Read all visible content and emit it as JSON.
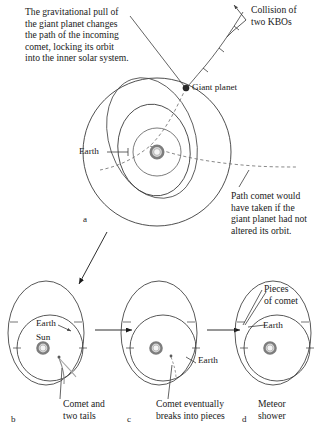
{
  "figure": {
    "background_color": "#ffffff",
    "ink_color": "#1a1a1a",
    "sun_color": "#8f8f8f",
    "planet_color": "#2b2b2b"
  },
  "panel_a": {
    "letter": "a",
    "caption_main": "The gravitational pull of\nthe giant planet changes\nthe path of the incoming\ncomet, locking its orbit\ninto the inner solar system.",
    "collision_label": "Collision of\ntwo KBOs",
    "giant_planet_label": "Giant planet",
    "earth_label": "Earth",
    "dashed_path_label": "Path comet would\nhave taken if the\ngiant planet had not\naltered its orbit."
  },
  "panel_b": {
    "letter": "b",
    "earth_label": "Earth",
    "sun_label": "Sun",
    "comet_label": "Comet and\ntwo tails"
  },
  "panel_c": {
    "letter": "c",
    "earth_label": "Earth",
    "comet_label": "Comet eventually\nbreaks into pieces"
  },
  "panel_d": {
    "letter": "d",
    "pieces_label": "Pieces\nof comet",
    "earth_label": "Earth",
    "meteor_label": "Meteor\nshower"
  }
}
